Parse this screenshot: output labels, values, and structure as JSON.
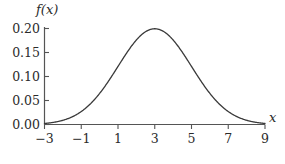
{
  "figure": {
    "background_color": "#ffffff",
    "axis_color": "#555555",
    "curve_color": "#3a3a3a",
    "text_color": "#2b2b2b",
    "y_axis_name": "f(x)",
    "x_axis_name": "x"
  },
  "chart_data": {
    "type": "line",
    "title": "",
    "subtitle": "",
    "xlabel": "x",
    "ylabel": "f(x)",
    "xlim": [
      -3,
      9
    ],
    "ylim": [
      0,
      0.21
    ],
    "grid": false,
    "legend": null,
    "x_ticks": [
      -3,
      -1,
      1,
      3,
      5,
      7,
      9
    ],
    "x_tick_labels": [
      "−3",
      "−1",
      "1",
      "3",
      "5",
      "7",
      "9"
    ],
    "y_ticks": [
      0.0,
      0.05,
      0.1,
      0.15,
      0.2
    ],
    "y_tick_labels": [
      "0.00",
      "0.05",
      "0.10",
      "0.15",
      "0.20"
    ],
    "distribution": {
      "mean": 3,
      "standard_deviation": 2,
      "peak_value": 0.1995
    },
    "series": [
      {
        "name": "f(x)",
        "x": [
          -3,
          -2.5,
          -2,
          -1.5,
          -1,
          -0.5,
          0,
          0.5,
          1,
          1.5,
          2,
          2.5,
          3,
          3.5,
          4,
          4.5,
          5,
          5.5,
          6,
          6.5,
          7,
          7.5,
          8,
          8.5,
          9
        ],
        "values": [
          0.0022,
          0.0037,
          0.0088,
          0.0158,
          0.027,
          0.044,
          0.0648,
          0.0913,
          0.121,
          0.1506,
          0.176,
          0.1936,
          0.1995,
          0.1936,
          0.176,
          0.1506,
          0.121,
          0.0913,
          0.0648,
          0.044,
          0.027,
          0.0158,
          0.0088,
          0.0037,
          0.0022
        ]
      }
    ]
  }
}
